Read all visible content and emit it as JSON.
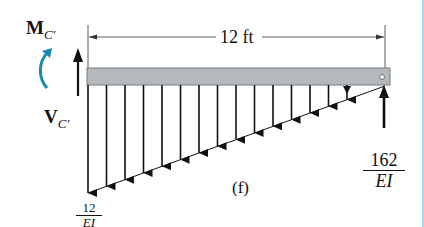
{
  "figure": {
    "caption": "(f)",
    "span_label": "12 ft",
    "moment_label": {
      "main": "M",
      "subscript": "C′"
    },
    "shear_label": {
      "main": "V",
      "subscript": "C′"
    },
    "left_load": {
      "numerator": "12",
      "denominator": "EI"
    },
    "right_reaction": {
      "numerator": "162",
      "denominator": "EI"
    },
    "colors": {
      "beam_fill": "#b4b9bc",
      "beam_edge": "#777c80",
      "moment_arrow": "#1e88b4",
      "ink": "#111111",
      "edge_line": "#a8d8ec"
    },
    "load": {
      "type": "triangular distributed load",
      "max_at": "left",
      "max_value": "12/EI",
      "zero_at": "right",
      "arrow_count": 16
    }
  }
}
